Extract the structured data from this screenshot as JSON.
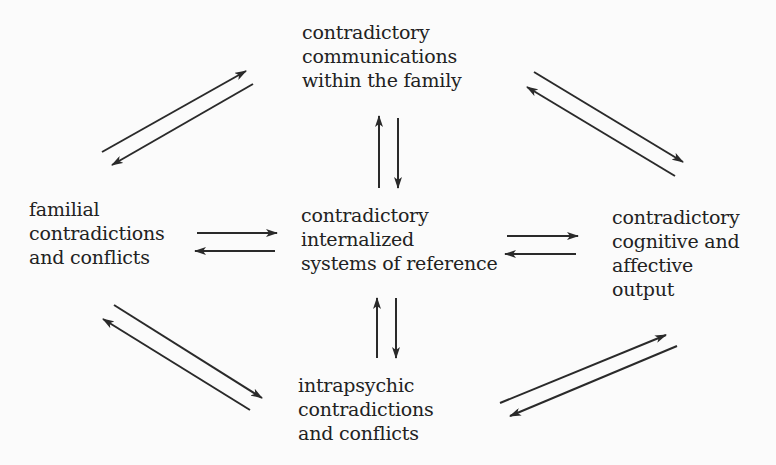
{
  "diagram": {
    "nodes": {
      "top": {
        "lines": [
          "contradictory",
          "communications",
          "within the family"
        ]
      },
      "left": {
        "lines": [
          "familial",
          "contradictions",
          "and conflicts"
        ]
      },
      "center": {
        "lines": [
          "contradictory",
          "internalized",
          "systems of reference"
        ]
      },
      "right": {
        "lines": [
          "contradictory",
          "cognitive and",
          "affective",
          "output"
        ]
      },
      "bottom": {
        "lines": [
          "intrapsychic",
          "contradictions",
          "and conflicts"
        ]
      }
    },
    "edges": [
      {
        "from": "left",
        "to": "top",
        "bidirectional": true
      },
      {
        "from": "top",
        "to": "right",
        "bidirectional": true
      },
      {
        "from": "left",
        "to": "center",
        "bidirectional": true
      },
      {
        "from": "center",
        "to": "right",
        "bidirectional": true
      },
      {
        "from": "top",
        "to": "center",
        "bidirectional": true
      },
      {
        "from": "center",
        "to": "bottom",
        "bidirectional": true
      },
      {
        "from": "left",
        "to": "bottom",
        "bidirectional": true
      },
      {
        "from": "bottom",
        "to": "right",
        "bidirectional": true
      }
    ],
    "colors": {
      "background": "#fbfbfb",
      "text": "#222222",
      "arrow": "#2a2a2a"
    }
  }
}
